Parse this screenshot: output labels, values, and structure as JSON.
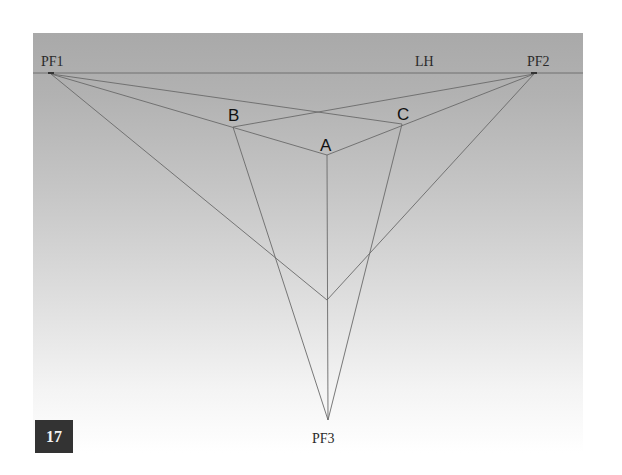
{
  "figure": {
    "number": "17",
    "horizon_label": "LH",
    "vanishing_points": [
      {
        "label": "PF1",
        "x": 51,
        "y": 73
      },
      {
        "label": "PF2",
        "x": 534,
        "y": 73
      },
      {
        "label": "PF3",
        "x": 328,
        "y": 420
      }
    ],
    "corner_points": [
      {
        "label": "A",
        "x": 327,
        "y": 155
      },
      {
        "label": "B",
        "x": 233,
        "y": 127
      },
      {
        "label": "C",
        "x": 402,
        "y": 124
      }
    ],
    "bottom_vertex": {
      "x": 327,
      "y": 300
    },
    "colors": {
      "panel_top": "#a9a9a9",
      "panel_bottom": "#ffffff",
      "line": "#6a6a6a",
      "badge_bg": "#333333",
      "badge_text": "#f2f2f2"
    }
  },
  "labels": {
    "pf1": "PF1",
    "pf2": "PF2",
    "pf3": "PF3",
    "lh": "LH",
    "a": "A",
    "b": "B",
    "c": "C",
    "badge": "17"
  }
}
